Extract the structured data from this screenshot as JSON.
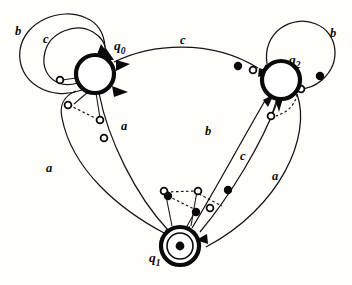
{
  "figure": {
    "kind": "state-transition-diagram",
    "background_color": "#fffefb",
    "ink_color": "#0a0a0a",
    "width": 352,
    "height": 285
  },
  "states": [
    {
      "id": "q0",
      "name": "q",
      "subscript": "0",
      "label": "q0",
      "cx": 95,
      "cy": 74,
      "r": 19,
      "style": "bold-circle",
      "marked": false,
      "label_x": 117,
      "label_y": 46
    },
    {
      "id": "q1",
      "name": "q",
      "subscript": "1",
      "label": "q1",
      "cx": 180,
      "cy": 246,
      "r": 19,
      "style": "bold-circle-with-dot",
      "marked": true,
      "label_x": 152,
      "label_y": 262
    },
    {
      "id": "q2",
      "name": "q",
      "subscript": "2",
      "label": "q2",
      "cx": 281,
      "cy": 80,
      "r": 19,
      "style": "bold-circle",
      "marked": false,
      "label_x": 292,
      "label_y": 62
    }
  ],
  "alphabet": [
    "a",
    "b",
    "c"
  ],
  "edge_labels": [
    {
      "id": "lbl-b-q0-loop",
      "text": "b",
      "x": 15,
      "y": 35,
      "edge": "q0-self-b"
    },
    {
      "id": "lbl-c-q0-loop",
      "text": "c",
      "x": 43,
      "y": 43,
      "edge": "q0-self-c"
    },
    {
      "id": "lbl-c-top",
      "text": "c",
      "x": 180,
      "y": 44,
      "edge": "q0-to-q2-c"
    },
    {
      "id": "lbl-b-q2-loop",
      "text": "b",
      "x": 330,
      "y": 37,
      "edge": "q2-self-b"
    },
    {
      "id": "lbl-a-left",
      "text": "a",
      "x": 46,
      "y": 172,
      "edge": "q1-to-q0-a"
    },
    {
      "id": "lbl-a-mid",
      "text": "a",
      "x": 121,
      "y": 130,
      "edge": "q0-to-q1-a"
    },
    {
      "id": "lbl-b-mid",
      "text": "b",
      "x": 205,
      "y": 135,
      "edge": "q1-to-q2-b"
    },
    {
      "id": "lbl-c-right",
      "text": "c",
      "x": 240,
      "y": 160,
      "edge": "q2-to-q1-c"
    },
    {
      "id": "lbl-a-right",
      "text": "a",
      "x": 272,
      "y": 180,
      "edge": "q2-to-q1-a"
    }
  ],
  "transitions": [
    {
      "id": "q0-self-b",
      "from": "q0",
      "to": "q0",
      "symbol": "b",
      "kind": "self-loop-outer"
    },
    {
      "id": "q0-self-c",
      "from": "q0",
      "to": "q0",
      "symbol": "c",
      "kind": "self-loop-inner"
    },
    {
      "id": "q0-to-q2-c",
      "from": "q0",
      "to": "q2",
      "symbol": "c",
      "kind": "arc-top"
    },
    {
      "id": "q2-self-b",
      "from": "q2",
      "to": "q2",
      "symbol": "b",
      "kind": "self-loop-outer"
    },
    {
      "id": "q0-to-q1-a",
      "from": "q0",
      "to": "q1",
      "symbol": "a",
      "kind": "arc"
    },
    {
      "id": "q1-to-q0-a",
      "from": "q1",
      "to": "q0",
      "symbol": "a",
      "kind": "arc"
    },
    {
      "id": "q1-to-q2-b",
      "from": "q1",
      "to": "q2",
      "symbol": "b",
      "kind": "arc"
    },
    {
      "id": "q2-to-q1-c",
      "from": "q2",
      "to": "q1",
      "symbol": "c",
      "kind": "arc"
    },
    {
      "id": "q2-to-q1-a",
      "from": "q2",
      "to": "q1",
      "symbol": "a",
      "kind": "arc"
    }
  ],
  "markers": {
    "hollow_count": 9,
    "filled_count": 5,
    "hollow_radius": 3.4,
    "filled_radius": 3.6
  }
}
